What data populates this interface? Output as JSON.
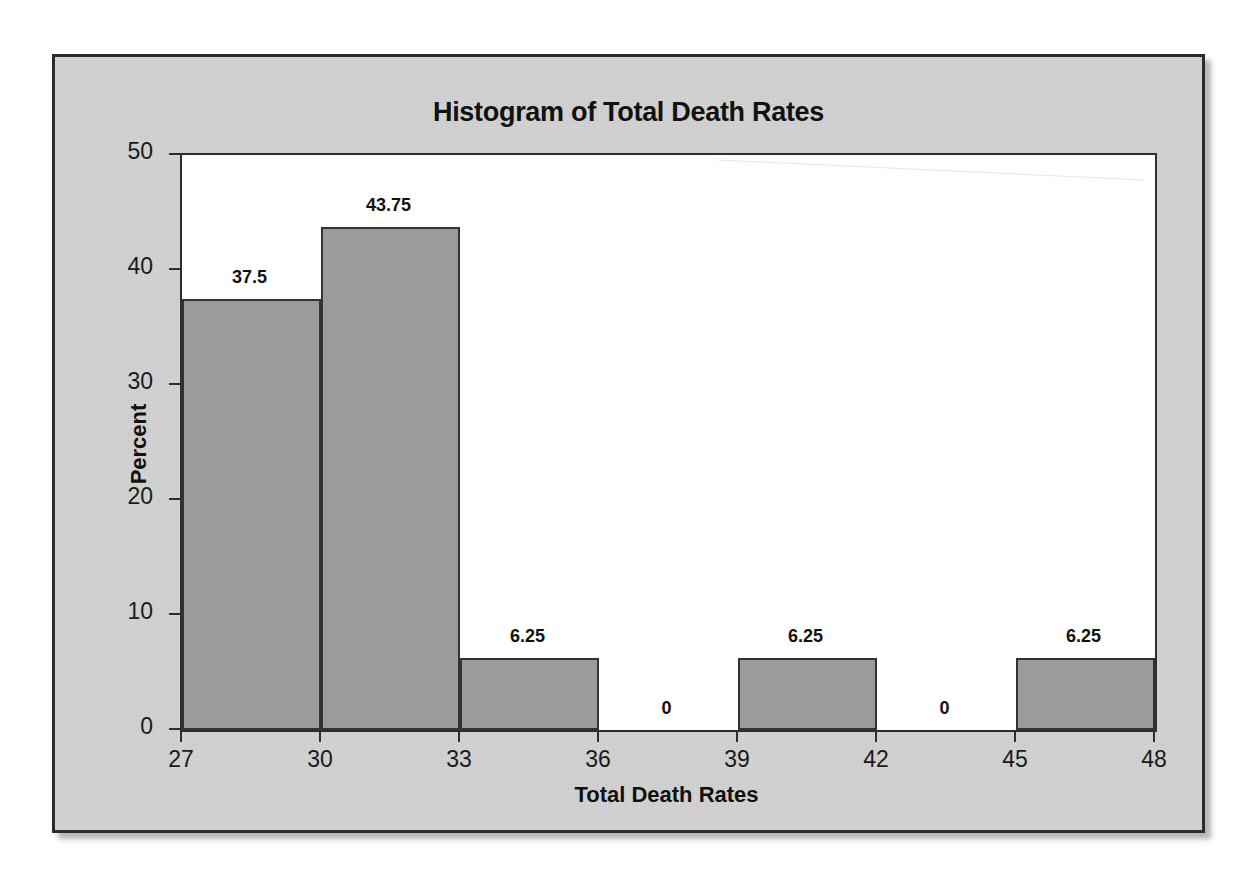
{
  "figure": {
    "title": "Histogram of Total Death Rates",
    "plate_color": "#d2d2d2",
    "bar_fill_color": "#9b9b9b",
    "bar_edge_color": "#333333",
    "plot_background": "#ffffff",
    "axis_color": "#2e2e2e"
  },
  "chart_data": {
    "type": "bar",
    "title": "Histogram of Total Death Rates",
    "xlabel": "Total Death Rates",
    "ylabel": "Percent",
    "grid": false,
    "legend": false,
    "xlim": [
      27,
      48
    ],
    "ylim": [
      0,
      50
    ],
    "x_ticks": [
      27,
      30,
      33,
      36,
      39,
      42,
      45,
      48
    ],
    "x_tick_labels": [
      "27",
      "30",
      "33",
      "36",
      "39",
      "42",
      "45",
      "48"
    ],
    "y_ticks": [
      0,
      10,
      20,
      30,
      40,
      50
    ],
    "y_tick_labels": [
      "0",
      "10",
      "20",
      "30",
      "40",
      "50"
    ],
    "bin_width": 3,
    "bin_edges": [
      27,
      30,
      33,
      36,
      39,
      42,
      45,
      48
    ],
    "categories": [
      "27-30",
      "30-33",
      "33-36",
      "36-39",
      "39-42",
      "42-45",
      "45-48"
    ],
    "values": [
      37.5,
      43.75,
      6.25,
      0,
      6.25,
      0,
      6.25
    ],
    "data_labels": [
      "37.5",
      "43.75",
      "6.25",
      "0",
      "6.25",
      "0",
      "6.25"
    ],
    "bars": [
      {
        "bin_start": 27,
        "bin_end": 30,
        "value": 37.5,
        "label": "37.5"
      },
      {
        "bin_start": 30,
        "bin_end": 33,
        "value": 43.75,
        "label": "43.75"
      },
      {
        "bin_start": 33,
        "bin_end": 36,
        "value": 6.25,
        "label": "6.25"
      },
      {
        "bin_start": 36,
        "bin_end": 39,
        "value": 0,
        "label": "0"
      },
      {
        "bin_start": 39,
        "bin_end": 42,
        "value": 6.25,
        "label": "6.25"
      },
      {
        "bin_start": 42,
        "bin_end": 45,
        "value": 0,
        "label": "0"
      },
      {
        "bin_start": 45,
        "bin_end": 48,
        "value": 6.25,
        "label": "6.25"
      }
    ]
  }
}
